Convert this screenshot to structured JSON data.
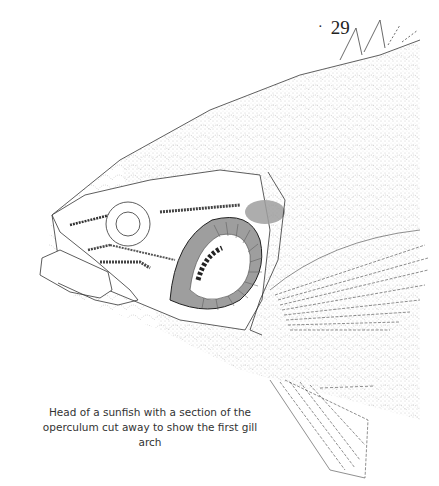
{
  "page": {
    "number_prefix": "·",
    "number": "29"
  },
  "figure": {
    "caption_line1": "Head of a sunfish with a section of the",
    "caption_line2": "operculum cut away to show the first gill arch"
  }
}
